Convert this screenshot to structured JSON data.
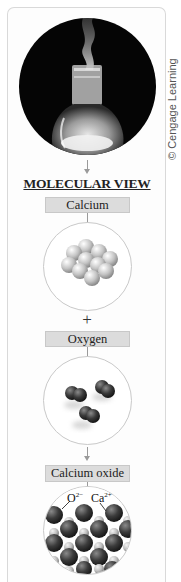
{
  "figure": {
    "photo": {
      "description": "Flask with white smoke on black circular background",
      "icon": "flask-smoke-photo"
    },
    "copyright": "© Cengage Learning",
    "heading": "MOLECULAR VIEW",
    "panels": [
      {
        "label": "Calcium",
        "model": "calcium-atoms-cluster"
      },
      {
        "operator": "+"
      },
      {
        "label": "Oxygen",
        "model": "oxygen-molecules"
      },
      {
        "label": "Calcium oxide",
        "model": "calcium-oxide-lattice",
        "ion_labels": [
          {
            "symbol": "O",
            "charge": "2−"
          },
          {
            "symbol": "Ca",
            "charge": "2+"
          }
        ]
      }
    ],
    "colors": {
      "label_box": "#dcdcdc",
      "ring_border": "#c9c9c9",
      "arrow": "#9a9a9a",
      "calcium_sphere": "#c8c8c8",
      "oxygen_sphere": "#3a3a3a"
    }
  }
}
